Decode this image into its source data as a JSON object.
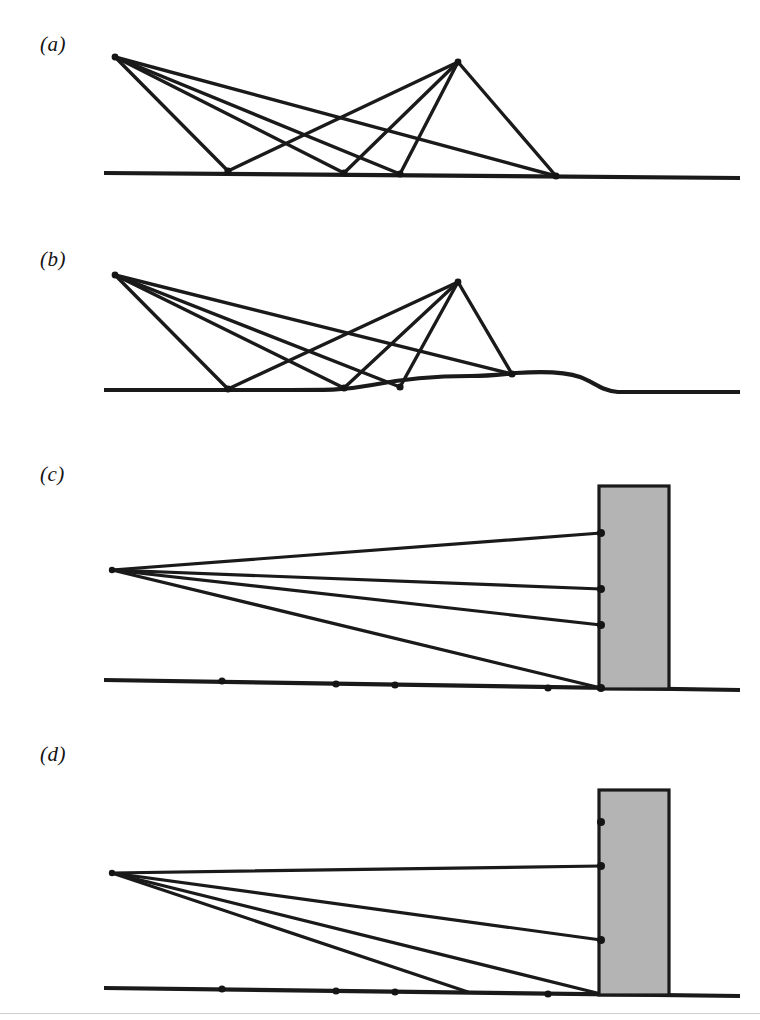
{
  "figure": {
    "background_color": "#ffffff",
    "ink_color": "#1a1a1a",
    "barrier_fill_color": "#b4b4b4",
    "barrier_edge_color": "#1a1a1a",
    "width": 760,
    "height": 1020
  },
  "panels": [
    {
      "id": "a",
      "label": "(a)",
      "label_x": 40,
      "label_y": 32,
      "caption": "Multiple ray paths between two elevated points over flat ground",
      "origin_y": 0,
      "height": 215,
      "ground": {
        "name": "flat-ground-line",
        "points": "104,173 740,178",
        "stroke_width": 4.2
      },
      "apexes": [
        {
          "name": "left-apex",
          "x": 115,
          "y": 57
        },
        {
          "name": "right-apex",
          "x": 458,
          "y": 62
        }
      ],
      "ground_nodes": [
        {
          "name": "ground-node-1",
          "x": 228,
          "y": 171
        },
        {
          "name": "ground-node-2",
          "x": 344,
          "y": 173
        },
        {
          "name": "ground-node-3",
          "x": 400,
          "y": 174
        },
        {
          "name": "ground-node-4",
          "x": 556,
          "y": 176
        }
      ],
      "rays": [
        {
          "name": "ray-a1",
          "from": [
            115,
            57
          ],
          "to": [
            228,
            171
          ],
          "stroke_width": 3.4
        },
        {
          "name": "ray-a2",
          "from": [
            115,
            57
          ],
          "to": [
            344,
            173
          ],
          "stroke_width": 3.4
        },
        {
          "name": "ray-a3",
          "from": [
            115,
            57
          ],
          "to": [
            400,
            174
          ],
          "stroke_width": 3.4
        },
        {
          "name": "ray-a4",
          "from": [
            115,
            57
          ],
          "to": [
            556,
            176
          ],
          "stroke_width": 3.4
        },
        {
          "name": "ray-a5",
          "from": [
            458,
            62
          ],
          "to": [
            228,
            171
          ],
          "stroke_width": 3.4
        },
        {
          "name": "ray-a6",
          "from": [
            458,
            62
          ],
          "to": [
            344,
            173
          ],
          "stroke_width": 3.4
        },
        {
          "name": "ray-a7",
          "from": [
            458,
            62
          ],
          "to": [
            400,
            174
          ],
          "stroke_width": 3.4
        },
        {
          "name": "ray-a8",
          "from": [
            458,
            62
          ],
          "to": [
            556,
            176
          ],
          "stroke_width": 3.4
        }
      ],
      "barrier": null
    },
    {
      "id": "b",
      "label": "(b)",
      "label_x": 40,
      "label_y": 247,
      "caption": "Same ray paths over ground containing a smooth hill",
      "origin_y": 0,
      "height": 215,
      "ground": {
        "name": "hill-ground-line",
        "path": "M 104,390 L 290,390 C 330,390 345,390 372,385 C 412,377 444,376 470,376 C 490,376 504,374 516,373 C 545,371 566,372 580,377 C 594,382 602,391 618,392 L 740,392",
        "stroke_width": 4.2
      },
      "apexes": [
        {
          "name": "left-apex",
          "x": 115,
          "y": 275
        },
        {
          "name": "right-apex",
          "x": 458,
          "y": 282
        }
      ],
      "ground_nodes": [
        {
          "name": "ground-node-1",
          "x": 228,
          "y": 389
        },
        {
          "name": "ground-node-2",
          "x": 344,
          "y": 388
        },
        {
          "name": "ground-node-3",
          "x": 400,
          "y": 387
        },
        {
          "name": "ground-node-4",
          "x": 512,
          "y": 374
        }
      ],
      "rays": [
        {
          "name": "ray-b1",
          "from": [
            115,
            275
          ],
          "to": [
            228,
            389
          ],
          "stroke_width": 3.4
        },
        {
          "name": "ray-b2",
          "from": [
            115,
            275
          ],
          "to": [
            344,
            388
          ],
          "stroke_width": 3.4
        },
        {
          "name": "ray-b3",
          "from": [
            115,
            275
          ],
          "to": [
            400,
            387
          ],
          "stroke_width": 3.4
        },
        {
          "name": "ray-b4",
          "from": [
            115,
            275
          ],
          "to": [
            512,
            374
          ],
          "stroke_width": 3.4
        },
        {
          "name": "ray-b5",
          "from": [
            458,
            282
          ],
          "to": [
            228,
            389
          ],
          "stroke_width": 3.4
        },
        {
          "name": "ray-b6",
          "from": [
            458,
            282
          ],
          "to": [
            344,
            388
          ],
          "stroke_width": 3.4
        },
        {
          "name": "ray-b7",
          "from": [
            458,
            282
          ],
          "to": [
            400,
            387
          ],
          "stroke_width": 3.4
        },
        {
          "name": "ray-b8",
          "from": [
            458,
            282
          ],
          "to": [
            512,
            374
          ],
          "stroke_width": 3.4
        }
      ],
      "barrier": null
    },
    {
      "id": "c",
      "label": "(c)",
      "label_x": 40,
      "label_y": 462,
      "caption": "Diffracted ray paths from a source to the edge of a barrier on flat ground",
      "origin_y": 0,
      "height": 280,
      "ground": {
        "name": "flat-ground-line",
        "points": "104,680 740,690",
        "stroke_width": 4.2
      },
      "source": {
        "name": "source-point",
        "x": 112,
        "y": 570
      },
      "ground_nodes": [
        {
          "name": "ground-node-1",
          "x": 222,
          "y": 681
        },
        {
          "name": "ground-node-2",
          "x": 336,
          "y": 684
        },
        {
          "name": "ground-node-3",
          "x": 395,
          "y": 685
        },
        {
          "name": "ground-node-4",
          "x": 548,
          "y": 688
        }
      ],
      "rays": [
        {
          "name": "ray-c1",
          "from": [
            112,
            570
          ],
          "to": [
            601,
            533
          ],
          "stroke_width": 3.2
        },
        {
          "name": "ray-c2",
          "from": [
            112,
            570
          ],
          "to": [
            601,
            589
          ],
          "stroke_width": 3.2
        },
        {
          "name": "ray-c3",
          "from": [
            112,
            570
          ],
          "to": [
            601,
            625
          ],
          "stroke_width": 3.2
        },
        {
          "name": "ray-c4",
          "from": [
            112,
            570
          ],
          "to": [
            601,
            688
          ],
          "stroke_width": 3.2
        }
      ],
      "barrier": {
        "name": "acoustic-barrier",
        "x": 599,
        "y": 486,
        "width": 70,
        "height": 203,
        "fill": "#b4b4b4",
        "stroke": "#1a1a1a",
        "stroke_width": 3.2
      },
      "barrier_nodes": [
        {
          "name": "barrier-node-1",
          "x": 601,
          "y": 533
        },
        {
          "name": "barrier-node-2",
          "x": 601,
          "y": 589
        },
        {
          "name": "barrier-node-3",
          "x": 601,
          "y": 625
        },
        {
          "name": "barrier-node-4",
          "x": 601,
          "y": 688
        }
      ]
    },
    {
      "id": "d",
      "label": "(d)",
      "label_x": 40,
      "label_y": 742,
      "caption": "Diffracted ray paths to a taller barrier with one shadowed edge point",
      "origin_y": 0,
      "height": 250,
      "ground": {
        "name": "flat-ground-line",
        "points": "104,988 740,996",
        "stroke_width": 4.2
      },
      "source": {
        "name": "source-point",
        "x": 112,
        "y": 873
      },
      "ground_nodes": [
        {
          "name": "ground-node-1",
          "x": 222,
          "y": 989
        },
        {
          "name": "ground-node-2",
          "x": 336,
          "y": 991
        },
        {
          "name": "ground-node-3",
          "x": 395,
          "y": 992
        },
        {
          "name": "ground-node-4",
          "x": 548,
          "y": 994
        }
      ],
      "rays": [
        {
          "name": "ray-d1",
          "from": [
            112,
            873
          ],
          "to": [
            601,
            866
          ],
          "stroke_width": 3.2
        },
        {
          "name": "ray-d2",
          "from": [
            112,
            873
          ],
          "to": [
            601,
            940
          ],
          "stroke_width": 3.2
        },
        {
          "name": "ray-d3",
          "from": [
            112,
            873
          ],
          "to": [
            601,
            994
          ],
          "stroke_width": 3.2
        },
        {
          "name": "ray-d4",
          "from": [
            112,
            873
          ],
          "to": [
            468,
            992
          ],
          "stroke_width": 3.2
        }
      ],
      "barrier": {
        "name": "acoustic-barrier",
        "x": 599,
        "y": 790,
        "width": 70,
        "height": 205,
        "fill": "#b4b4b4",
        "stroke": "#1a1a1a",
        "stroke_width": 3.2
      },
      "barrier_nodes": [
        {
          "name": "barrier-node-shadowed",
          "x": 601,
          "y": 822
        },
        {
          "name": "barrier-node-1",
          "x": 601,
          "y": 866
        },
        {
          "name": "barrier-node-2",
          "x": 601,
          "y": 940
        }
      ]
    }
  ],
  "footer": {
    "rule_y": 1013,
    "rule_color": "#cfcfcf"
  }
}
